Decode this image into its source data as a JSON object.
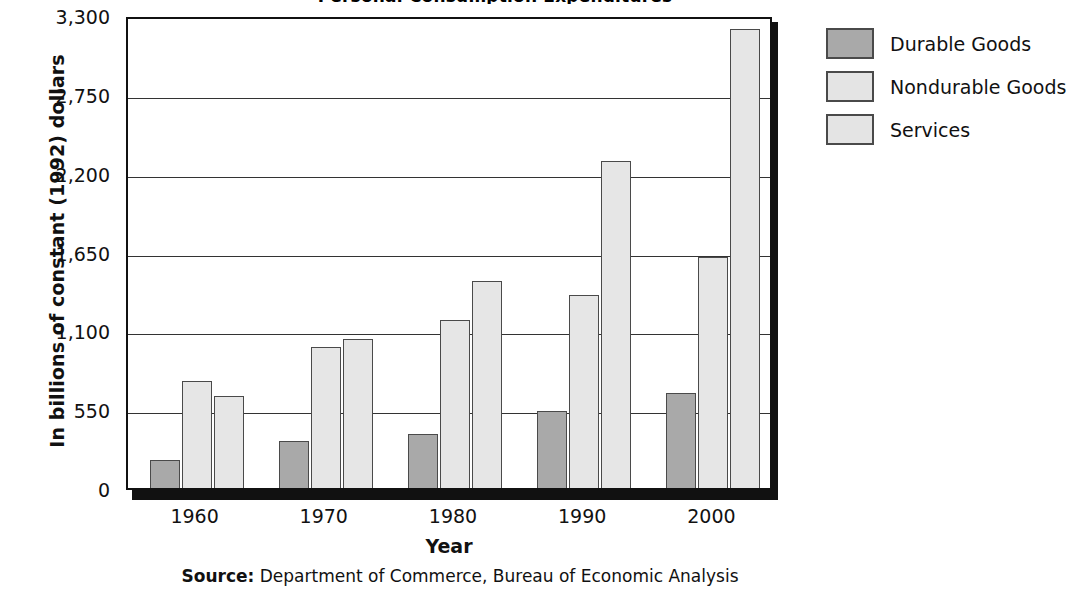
{
  "chart_data": {
    "type": "bar",
    "title": "Personal Consumption Expenditures",
    "categories": [
      "1960",
      "1970",
      "1980",
      "1990",
      "2000"
    ],
    "series": [
      {
        "name": "Durable Goods",
        "values": [
          195,
          330,
          375,
          535,
          665
        ],
        "color": "#a9a9a9"
      },
      {
        "name": "Nondurable Goods",
        "values": [
          750,
          985,
          1170,
          1350,
          1610
        ],
        "color": "#e6e6e6"
      },
      {
        "name": "Services",
        "values": [
          640,
          1040,
          1445,
          2280,
          3200
        ],
        "color": "#e6e6e6"
      }
    ],
    "xlabel": "Year",
    "ylabel": "In billions of constant (1992) dollars",
    "ylim": [
      0,
      3300
    ],
    "yticks": [
      "0",
      "550",
      "1,100",
      "1,650",
      "2,200",
      "2,750",
      "3,300"
    ],
    "ytick_values": [
      0,
      550,
      1100,
      1650,
      2200,
      2750,
      3300
    ],
    "grid": "horizontal",
    "legend_position": "right"
  },
  "axis": {
    "y_title": "In billions of constant (1992) dollars",
    "x_title": "Year"
  },
  "legend": {
    "items": [
      {
        "label": "Durable Goods"
      },
      {
        "label": "Nondurable Goods"
      },
      {
        "label": "Services"
      }
    ]
  },
  "source": {
    "prefix": "Source:",
    "text": " Department of Commerce, Bureau of Economic Analysis"
  }
}
